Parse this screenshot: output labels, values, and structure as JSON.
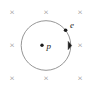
{
  "figure": {
    "kind": "physics-diagram",
    "width": 96,
    "height": 89,
    "background_color": "#ffffff"
  },
  "magnetic_field": {
    "symbol": "×",
    "icon_name": "field-into-page-cross",
    "color": "#8d8d8d",
    "meaning": "into the page",
    "marks": [
      {
        "id": "cross-top-left",
        "x": 12,
        "y": 12
      },
      {
        "id": "cross-top-center",
        "x": 46,
        "y": 12
      },
      {
        "id": "cross-top-right",
        "x": 80,
        "y": 12
      },
      {
        "id": "cross-middle-left",
        "x": 12,
        "y": 45
      },
      {
        "id": "cross-middle-right",
        "x": 80,
        "y": 45
      },
      {
        "id": "cross-bottom-left",
        "x": 12,
        "y": 78
      },
      {
        "id": "cross-bottom-center",
        "x": 46,
        "y": 78
      },
      {
        "id": "cross-bottom-right",
        "x": 80,
        "y": 78
      }
    ]
  },
  "orbit": {
    "center_x": 46,
    "center_y": 45.5,
    "radius": 24.8,
    "stroke_color": "#8a8a8a",
    "stroke_width": 0.9
  },
  "direction_marker": {
    "icon_name": "arrowhead-clockwise",
    "points": "68.2,41.4 71.6,45.6 68.2,49.6",
    "color": "#1b1b1b"
  },
  "particles": [
    {
      "id": "proton",
      "label": "p",
      "dot_x": 42,
      "dot_y": 45.3,
      "dot_r": 1.7,
      "label_x": 46.5,
      "label_y": 45.8,
      "color": "#1b1b1b"
    },
    {
      "id": "electron",
      "label": "e",
      "dot_x": 65.6,
      "dot_y": 30.2,
      "dot_r": 1.8,
      "label_x": 70.0,
      "label_y": 24.5,
      "color": "#1b1b1b"
    }
  ]
}
